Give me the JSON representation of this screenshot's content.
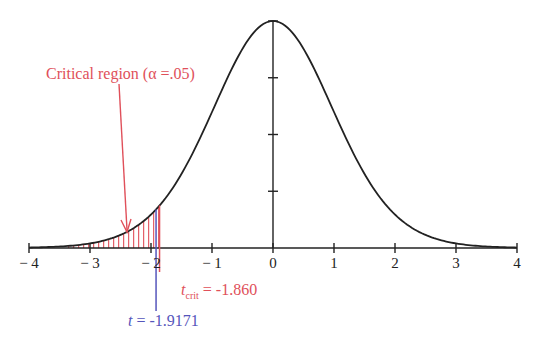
{
  "chart_data": {
    "type": "line",
    "title": "",
    "xlabel": "",
    "ylabel": "",
    "xlim": [
      -4,
      4
    ],
    "x_ticks": [
      -4,
      -3,
      -2,
      -1,
      0,
      1,
      2,
      3,
      4
    ],
    "x_tick_labels": [
      "− 4",
      "− 3",
      "− 2",
      "− 1",
      "0",
      "1",
      "2",
      "3",
      "4"
    ],
    "y_axis_ticks_count": 4,
    "grid": false,
    "legend": null,
    "series": [
      {
        "name": "t density",
        "color": "#222222",
        "x": [
          -4,
          -3,
          -2,
          -1,
          0,
          1,
          2,
          3,
          4
        ],
        "y_relative": [
          0.003,
          0.024,
          0.14,
          0.61,
          1.0,
          0.61,
          0.14,
          0.024,
          0.003
        ]
      }
    ],
    "shaded_region": {
      "from": -4,
      "to": -1.86,
      "color": "#e0505a",
      "style": "vertical hatch"
    },
    "annotations": [
      {
        "text": "Critical region (α =.05)",
        "color": "#e0505a",
        "points_to_x": -2.4
      },
      {
        "label_main": "t",
        "label_sub": "crit",
        "value_text": " = -1.860",
        "x": -1.86,
        "color": "#e0505a"
      },
      {
        "label_main": "t",
        "value_text": " = -1.9171",
        "x": -1.9171,
        "color": "#5555bb"
      }
    ]
  },
  "labels": {
    "critical_region": "Critical region (α =.05)",
    "tcrit_main": "t",
    "tcrit_sub": "crit",
    "tcrit_value": " = -1.860",
    "t_main": "t",
    "t_value": " = -1.9171"
  },
  "ticks": [
    "− 4",
    "− 3",
    "− 2",
    "− 1",
    "0",
    "1",
    "2",
    "3",
    "4"
  ]
}
